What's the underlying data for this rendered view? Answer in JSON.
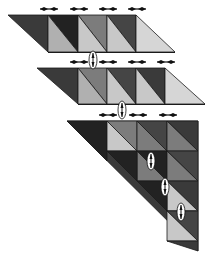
{
  "diagram": {
    "colors": {
      "background": "#ffffff",
      "edge": "#1a1a1a",
      "darkest": "#222222",
      "dark": "#3a3a3a",
      "dark2": "#454545",
      "mid": "#7c7c7c",
      "light": "#b0b0b0",
      "lighter": "#c8c8c8",
      "lightest": "#d6d6d6",
      "connector_fill": "#ffffff"
    },
    "strips": [
      {
        "id": "strip-1",
        "left_parallelogram": [
          [
            8,
            15
          ],
          [
            48,
            15
          ],
          [
            48,
            53
          ],
          [
            8,
            15
          ]
        ],
        "cells": [
          {
            "x0": 48,
            "x1": 78,
            "upper": "darkest",
            "lower": "light"
          },
          {
            "x0": 78,
            "x1": 107,
            "upper": "mid",
            "lower": "lighter"
          },
          {
            "x0": 107,
            "x1": 136,
            "upper": "dark2",
            "lower": "lighter"
          }
        ],
        "top": 15,
        "bottom": 52,
        "right_triangle": [
          [
            136,
            15
          ],
          [
            175,
            52
          ],
          [
            136,
            52
          ]
        ],
        "arrows_x": [
          49,
          79,
          108,
          137
        ],
        "arrows_y": 9
      },
      {
        "id": "strip-2",
        "left_parallelogram": [
          [
            37,
            68
          ],
          [
            78,
            68
          ],
          [
            78,
            104
          ]
        ],
        "cells": [
          {
            "x0": 78,
            "x1": 107,
            "upper": "mid",
            "lower": "light"
          },
          {
            "x0": 107,
            "x1": 136,
            "upper": "dark2",
            "lower": "lighter"
          },
          {
            "x0": 136,
            "x1": 165,
            "upper": "dark",
            "lower": "lighter"
          }
        ],
        "top": 68,
        "bottom": 104,
        "right_triangle": [
          [
            165,
            68
          ],
          [
            205,
            104
          ],
          [
            165,
            104
          ]
        ],
        "arrows_x": [
          79,
          108,
          137,
          166
        ],
        "arrows_y": 62
      }
    ],
    "big_triangle": {
      "id": "triangle-3",
      "apex_left": [
        67,
        121
      ],
      "top_right": [
        198,
        121
      ],
      "bottom_right": [
        198,
        251
      ],
      "columns": [
        107,
        137,
        167,
        198
      ],
      "rows": [
        121,
        151,
        181,
        211,
        241
      ],
      "cells": [
        {
          "r": 0,
          "c": 0,
          "upper": "mid",
          "lower": "lighter"
        },
        {
          "r": 0,
          "c": 1,
          "upper": "dark2",
          "lower": "mid"
        },
        {
          "r": 0,
          "c": 2,
          "upper": "dark",
          "lower": "mid"
        },
        {
          "r": 1,
          "c": 1,
          "upper": "darkest",
          "lower": "mid"
        },
        {
          "r": 1,
          "c": 2,
          "upper": "dark2",
          "lower": "mid"
        },
        {
          "r": 2,
          "c": 2,
          "upper": "dark",
          "lower": "lighter"
        }
      ],
      "arrows_x": [
        108,
        138,
        168
      ],
      "arrows_y": 115
    },
    "connectors": [
      {
        "id": "connector-1",
        "cx": 93,
        "cy": 60,
        "rx": 3,
        "ry": 9
      },
      {
        "id": "connector-2",
        "cx": 122,
        "cy": 110,
        "rx": 3,
        "ry": 9
      },
      {
        "id": "connector-3",
        "cx": 151,
        "cy": 161,
        "rx": 3,
        "ry": 9
      },
      {
        "id": "connector-4",
        "cx": 165,
        "cy": 187,
        "rx": 3,
        "ry": 9
      },
      {
        "id": "connector-5",
        "cx": 181,
        "cy": 212,
        "rx": 3,
        "ry": 9
      }
    ]
  }
}
